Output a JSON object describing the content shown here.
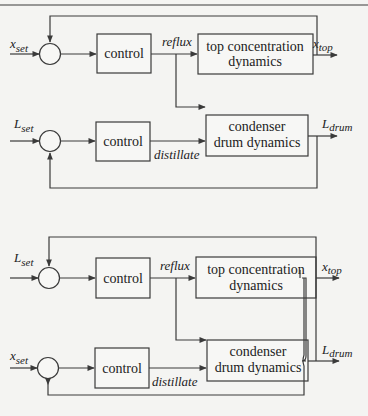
{
  "diagrams": [
    {
      "name": "top-configuration",
      "loops": [
        {
          "setpoint": {
            "main": "x",
            "sub": "set"
          },
          "controller": "control",
          "manipulated": "reflux"
        },
        {
          "setpoint": {
            "main": "L",
            "sub": "set"
          },
          "controller": "control",
          "manipulated": "distillate"
        }
      ],
      "processes": [
        {
          "line1": "top concentration",
          "line2": "dynamics"
        },
        {
          "line1": "condenser",
          "line2": "drum dynamics"
        }
      ],
      "outputs": [
        {
          "main": "x",
          "sub": "top"
        },
        {
          "main": "L",
          "sub": "drum"
        }
      ]
    },
    {
      "name": "bottom-configuration",
      "loops": [
        {
          "setpoint": {
            "main": "L",
            "sub": "set"
          },
          "controller": "control",
          "manipulated": "reflux"
        },
        {
          "setpoint": {
            "main": "x",
            "sub": "set"
          },
          "controller": "control",
          "manipulated": "distillate"
        }
      ],
      "processes": [
        {
          "line1": "top concentration",
          "line2": "dynamics"
        },
        {
          "line1": "condenser",
          "line2": "drum dynamics"
        }
      ],
      "outputs": [
        {
          "main": "x",
          "sub": "top"
        },
        {
          "main": "L",
          "sub": "drum"
        }
      ]
    }
  ]
}
